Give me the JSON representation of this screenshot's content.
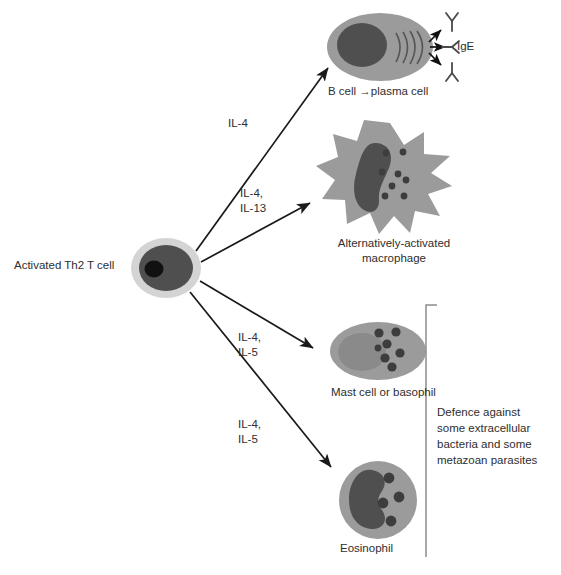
{
  "figure": {
    "width": 561,
    "height": 575,
    "background_color": "#ffffff"
  },
  "colors": {
    "cell_body": "#9b9b9b",
    "nucleus_dark": "#4f4f4f",
    "nucleus_black": "#111111",
    "cell_rim": "#d4d4d4",
    "mast_nucleus": "#8a8a8a",
    "granule": "#3d3d3d",
    "line": "#1a1a1a",
    "text": "#2e2e2e",
    "bracket": "#8c8c8c"
  },
  "source_cell": {
    "label": "Activated Th2 T cell",
    "name": "activated-th2-t-cell"
  },
  "cytokine_labels": [
    {
      "id": "il4-a",
      "text": "IL-4",
      "target": "b-cell"
    },
    {
      "id": "il4-il13",
      "text": "IL-4,\nIL-13",
      "target": "macrophage"
    },
    {
      "id": "il4-il5-a",
      "text": "IL-4,\nIL-5",
      "target": "mast-cell"
    },
    {
      "id": "il4-il5-b",
      "text": "IL-4,\nIL-5",
      "target": "eosinophil"
    }
  ],
  "target_cells": [
    {
      "id": "b-cell",
      "label": "B cell →plasma cell",
      "secretion_label": "IgE",
      "granule_count": 0,
      "antibody_count": 3,
      "secretion_arc_count": 4
    },
    {
      "id": "macrophage",
      "label": "Alternatively-activated\nmacrophage",
      "granule_count": 8,
      "spike_count": 12
    },
    {
      "id": "mast-cell",
      "label": "Mast cell or basophil",
      "granule_count": 7
    },
    {
      "id": "eosinophil",
      "label": "Eosinophil",
      "granule_count": 4,
      "nucleus_lobes": 2
    }
  ],
  "bracket": {
    "label": "Defence against\nsome extracellular\nbacteria and some\nmetazoan parasites",
    "covers": [
      "mast-cell",
      "eosinophil"
    ]
  }
}
